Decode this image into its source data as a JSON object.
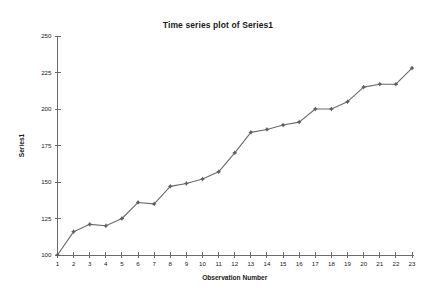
{
  "chart_data": {
    "type": "line",
    "title": "Time series plot of Series1",
    "xlabel": "Observation Number",
    "ylabel": "Series1",
    "x": [
      1,
      2,
      3,
      4,
      5,
      6,
      7,
      8,
      9,
      10,
      11,
      12,
      13,
      14,
      15,
      16,
      17,
      18,
      19,
      20,
      21,
      22,
      23
    ],
    "values": [
      100,
      116,
      121,
      120,
      125,
      136,
      135,
      147,
      149,
      152,
      157,
      170,
      184,
      186,
      189,
      191,
      200,
      200,
      205,
      215,
      217,
      217,
      228
    ],
    "series": [
      {
        "name": "Series1",
        "values": [
          100,
          116,
          121,
          120,
          125,
          136,
          135,
          147,
          149,
          152,
          157,
          170,
          184,
          186,
          189,
          191,
          200,
          200,
          205,
          215,
          217,
          217,
          228
        ]
      }
    ],
    "xtick_labels": [
      "1",
      "2",
      "3",
      "4",
      "5",
      "6",
      "7",
      "8",
      "9",
      "10",
      "11",
      "12",
      "13",
      "14",
      "15",
      "16",
      "17",
      "18",
      "19",
      "20",
      "21",
      "22",
      "23"
    ],
    "ytick_labels": [
      "100",
      "125",
      "150",
      "175",
      "200",
      "225",
      "250"
    ],
    "ytick_values": [
      100,
      125,
      150,
      175,
      200,
      225,
      250
    ],
    "xlim": [
      1,
      23
    ],
    "ylim": [
      100,
      250
    ],
    "grid": false,
    "legend": false,
    "marker": "plus-dot",
    "line_color": "#6a6a6a",
    "marker_color": "#5d5d5d",
    "background_color": "#ffffff",
    "text_color": "#1a1a1a"
  }
}
